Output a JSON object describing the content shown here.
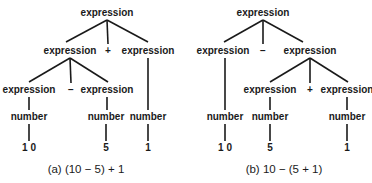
{
  "diagram_type": "parse-trees",
  "trees": [
    {
      "id": "a",
      "caption": "(a)  (10 − 5) + 1",
      "nodes": [
        {
          "id": "a0",
          "label": "expression",
          "x": 107,
          "y": 16
        },
        {
          "id": "a1",
          "label": "expression",
          "x": 70,
          "y": 54
        },
        {
          "id": "a2",
          "label": "+",
          "x": 108,
          "y": 54
        },
        {
          "id": "a3",
          "label": "expression",
          "x": 148,
          "y": 54
        },
        {
          "id": "a4",
          "label": "expression",
          "x": 29,
          "y": 93
        },
        {
          "id": "a5",
          "label": "−",
          "x": 71,
          "y": 93
        },
        {
          "id": "a6",
          "label": "expression",
          "x": 107,
          "y": 93
        },
        {
          "id": "a7",
          "label": "number",
          "x": 29,
          "y": 120
        },
        {
          "id": "a8",
          "label": "number",
          "x": 106,
          "y": 120
        },
        {
          "id": "a9",
          "label": "number",
          "x": 148,
          "y": 120
        },
        {
          "id": "a10",
          "label": "1 0",
          "x": 29,
          "y": 151
        },
        {
          "id": "a11",
          "label": "5",
          "x": 106,
          "y": 151
        },
        {
          "id": "a12",
          "label": "1",
          "x": 148,
          "y": 151
        }
      ],
      "edges": [
        [
          107,
          20,
          66,
          42
        ],
        [
          107,
          20,
          108,
          44
        ],
        [
          107,
          20,
          148,
          42
        ],
        [
          70,
          58,
          29,
          82
        ],
        [
          70,
          58,
          71,
          83
        ],
        [
          70,
          58,
          108,
          82
        ],
        [
          148,
          58,
          148,
          110
        ],
        [
          29,
          97,
          29,
          110
        ],
        [
          107,
          97,
          107,
          110
        ],
        [
          29,
          124,
          29,
          141
        ],
        [
          106,
          124,
          106,
          141
        ],
        [
          148,
          124,
          148,
          141
        ]
      ]
    },
    {
      "id": "b",
      "caption": "(b)  10 − (5 + 1)",
      "nodes": [
        {
          "id": "b0",
          "label": "expression",
          "x": 263,
          "y": 16
        },
        {
          "id": "b1",
          "label": "expression",
          "x": 223,
          "y": 54
        },
        {
          "id": "b2",
          "label": "−",
          "x": 263,
          "y": 54
        },
        {
          "id": "b3",
          "label": "expression",
          "x": 310,
          "y": 54
        },
        {
          "id": "b4",
          "label": "expression",
          "x": 270,
          "y": 93
        },
        {
          "id": "b5",
          "label": "+",
          "x": 310,
          "y": 93
        },
        {
          "id": "b6",
          "label": "expression",
          "x": 347,
          "y": 93
        },
        {
          "id": "b7",
          "label": "number",
          "x": 225,
          "y": 120
        },
        {
          "id": "b8",
          "label": "number",
          "x": 270,
          "y": 120
        },
        {
          "id": "b9",
          "label": "number",
          "x": 347,
          "y": 120
        },
        {
          "id": "b10",
          "label": "1 0",
          "x": 225,
          "y": 151
        },
        {
          "id": "b11",
          "label": "5",
          "x": 270,
          "y": 151
        },
        {
          "id": "b12",
          "label": "1",
          "x": 347,
          "y": 151
        }
      ],
      "edges": [
        [
          263,
          20,
          224,
          42
        ],
        [
          263,
          20,
          263,
          44
        ],
        [
          263,
          20,
          303,
          42
        ],
        [
          310,
          58,
          270,
          82
        ],
        [
          310,
          58,
          310,
          83
        ],
        [
          310,
          58,
          348,
          82
        ],
        [
          225,
          58,
          225,
          110
        ],
        [
          270,
          97,
          270,
          110
        ],
        [
          347,
          97,
          347,
          110
        ],
        [
          225,
          124,
          225,
          141
        ],
        [
          270,
          124,
          270,
          141
        ],
        [
          347,
          124,
          347,
          141
        ]
      ]
    }
  ],
  "captions": {
    "a": {
      "text": "(a)  (10 − 5) + 1",
      "x": 86,
      "y": 173
    },
    "b": {
      "text": "(b)  10 − (5 + 1)",
      "x": 284,
      "y": 173
    }
  }
}
